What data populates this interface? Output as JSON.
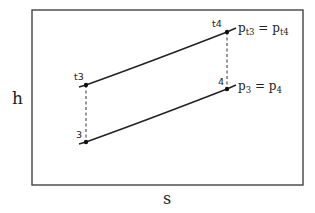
{
  "diagram": {
    "type": "h-s diagram",
    "axes": {
      "y_label": "h",
      "x_label": "s"
    },
    "points": [
      {
        "id": "t3",
        "label": "t3",
        "x": 86,
        "y": 85
      },
      {
        "id": "3",
        "label": "3",
        "x": 86,
        "y": 142
      },
      {
        "id": "t4",
        "label": "t4",
        "x": 227,
        "y": 32
      },
      {
        "id": "4",
        "label": "4",
        "x": 227,
        "y": 89
      }
    ],
    "isobars": [
      {
        "name": "upper",
        "from": "t3",
        "to": "t4",
        "label_base": "p",
        "label_sub1": "t3",
        "label_eq": " = ",
        "label_base2": "p",
        "label_sub2": "t4"
      },
      {
        "name": "lower",
        "from": "3",
        "to": "4",
        "label_base": "p",
        "label_sub1": "3",
        "label_eq": " = ",
        "label_base2": "p",
        "label_sub2": "4"
      }
    ],
    "dashed_connectors": [
      {
        "from": "t3",
        "to": "3"
      },
      {
        "from": "t4",
        "to": "4"
      }
    ],
    "colors": {
      "line": "#222222",
      "frame": "#444444"
    }
  }
}
